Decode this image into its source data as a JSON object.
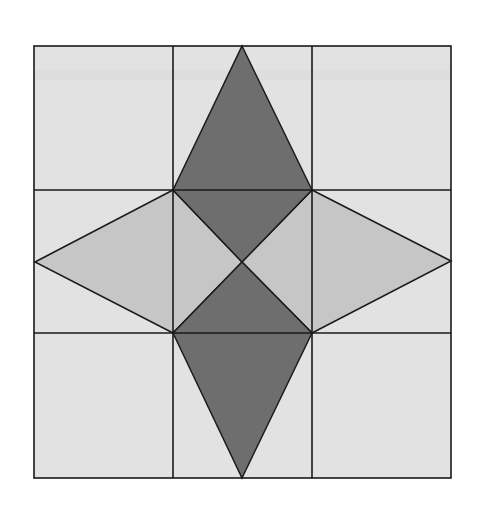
{
  "diagram": {
    "grid": {
      "left": 34,
      "top": 46,
      "right": 451,
      "bottom": 478,
      "cols": [
        34,
        173,
        312,
        451
      ],
      "rows": [
        46,
        190,
        333,
        478
      ]
    },
    "center": [
      242,
      262
    ],
    "colors": {
      "background": "#ffffff",
      "light": "#e2e2e2",
      "medium": "#c6c6c6",
      "dark": "#6e6e6e",
      "line": "#1a1a1a"
    },
    "shapes": {
      "top_kite": "242,46 312,190 242,262 173,190",
      "bottom_kite": "242,478 312,333 242,262 173,333",
      "left_kite": "35,262 173,190 242,262 173,333",
      "right_kite": "451,261 312,190 242,262 312,333"
    }
  }
}
